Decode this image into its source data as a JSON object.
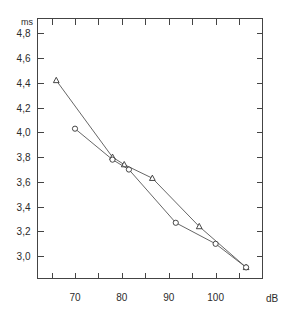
{
  "chart_data": {
    "type": "line",
    "title": "",
    "subtitle": "",
    "xlabel": "dB",
    "ylabel": "ms",
    "xlim": [
      62,
      110
    ],
    "ylim": [
      2.82,
      4.92
    ],
    "grid": false,
    "legend": "none",
    "x_tick_labels": [
      "70",
      "80",
      "90",
      "100"
    ],
    "x_tick_values": [
      70,
      80,
      90,
      100
    ],
    "x_minor_tick_values": [
      65,
      75,
      85,
      95,
      105
    ],
    "y_tick_labels": [
      "3,0",
      "3,2",
      "3,4",
      "3,6",
      "3,8",
      "4,0",
      "4,2",
      "4,4",
      "4,6",
      "4,8"
    ],
    "y_tick_values": [
      3.0,
      3.2,
      3.4,
      3.6,
      3.8,
      4.0,
      4.2,
      4.4,
      4.6,
      4.8
    ],
    "series": [
      {
        "name": "triangle-series",
        "marker": "triangle",
        "x": [
          66.0,
          78.0,
          80.5,
          86.5,
          96.5,
          106.5
        ],
        "values": [
          4.42,
          3.8,
          3.74,
          3.63,
          3.24,
          2.91
        ]
      },
      {
        "name": "circle-series",
        "marker": "circle",
        "x": [
          70.0,
          78.0,
          81.5,
          91.5,
          100.0,
          106.5
        ],
        "values": [
          4.03,
          3.78,
          3.7,
          3.27,
          3.1,
          2.91
        ]
      }
    ]
  },
  "axes": {
    "y_unit_label": "ms",
    "x_unit_label": "dB"
  },
  "caption": {
    "clipped_text": ""
  }
}
